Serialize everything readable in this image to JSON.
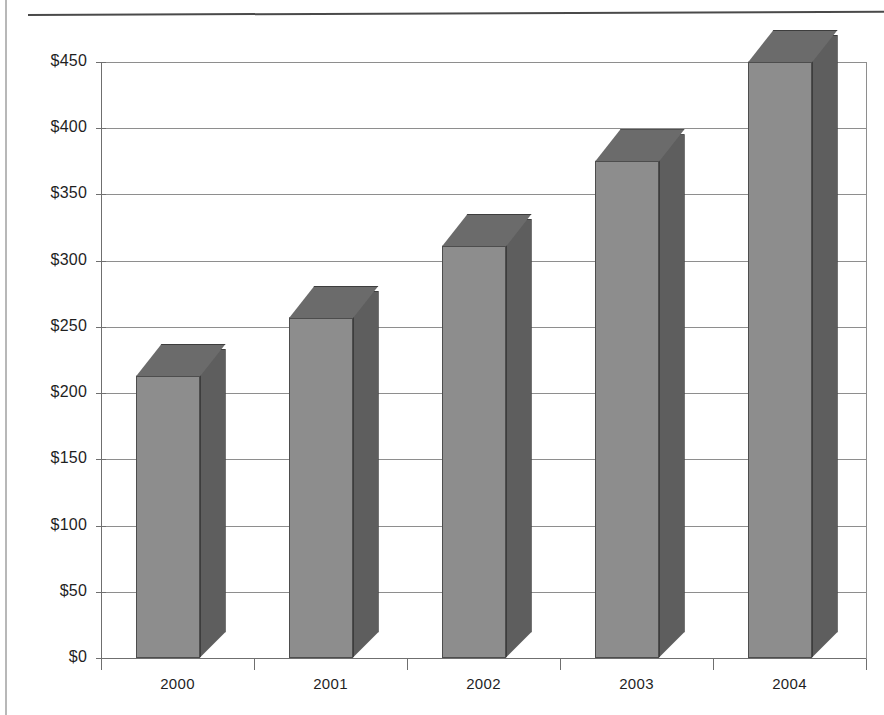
{
  "chart_data": {
    "type": "bar",
    "title": "",
    "subtitle": "",
    "xlabel": "",
    "ylabel": "",
    "categories": [
      "2000",
      "2001",
      "2002",
      "2003",
      "2004"
    ],
    "values": [
      213,
      257,
      311,
      375,
      450
    ],
    "ylim": [
      0,
      450
    ],
    "y_ticks": [
      0,
      50,
      100,
      150,
      200,
      250,
      300,
      350,
      400,
      450
    ],
    "y_tick_labels": [
      "$0",
      "$50",
      "$100",
      "$150",
      "$200",
      "$250",
      "$300",
      "$350",
      "$400",
      "$450"
    ],
    "grid": true,
    "legend": "none",
    "style": "3d-column",
    "series": [
      {
        "name": "Series 1",
        "values": [
          213,
          257,
          311,
          375,
          450
        ]
      }
    ],
    "colors": {
      "bar_front": "#8d8d8d",
      "bar_side": "#5e5e5e",
      "bar_top": "#6b6b6b",
      "bar_edge": "#3d3d3d",
      "gridline": "#8e8e8e",
      "axis": "#6f6f6f",
      "background": "#ffffff",
      "text": "#1f1f1f"
    }
  }
}
